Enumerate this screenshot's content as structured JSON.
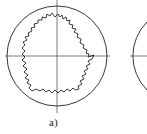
{
  "figure": {
    "panels": [
      {
        "label": "a)",
        "description": "Circle with irregular jagged star-shaped profile and center crosshair"
      },
      {
        "label": "",
        "description": "Partial circle with crosshair (cropped at right edge)"
      }
    ],
    "colors": {
      "stroke": "#222222",
      "background": "#ffffff"
    }
  }
}
